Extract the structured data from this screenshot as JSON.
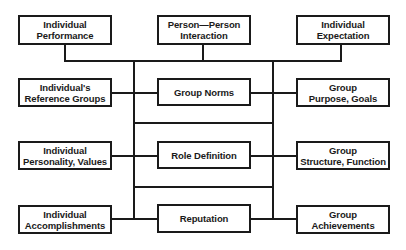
{
  "diagram": {
    "type": "block-diagram",
    "colors": {
      "stroke": "#1a1a1a",
      "background": "#ffffff",
      "text": "#1a1a1a"
    },
    "nodes": {
      "individual_performance": {
        "lines": [
          "Individual",
          "Performance"
        ]
      },
      "person_person_interaction": {
        "lines": [
          "Person—Person",
          "Interaction"
        ]
      },
      "individual_expectation": {
        "lines": [
          "Individual",
          "Expectation"
        ]
      },
      "reference_groups": {
        "lines": [
          "Individual's",
          "Reference Groups"
        ]
      },
      "group_norms": {
        "lines": [
          "Group Norms"
        ]
      },
      "group_purpose": {
        "lines": [
          "Group",
          "Purpose, Goals"
        ]
      },
      "personality_values": {
        "lines": [
          "Individual",
          "Personality, Values"
        ]
      },
      "role_definition": {
        "lines": [
          "Role Definition"
        ]
      },
      "group_structure": {
        "lines": [
          "Group",
          "Structure, Function"
        ]
      },
      "accomplishments": {
        "lines": [
          "Individual",
          "Accomplishments"
        ]
      },
      "reputation": {
        "lines": [
          "Reputation"
        ]
      },
      "group_achievements": {
        "lines": [
          "Group",
          "Achievements"
        ]
      }
    },
    "edges": [
      [
        "individual_performance",
        "central-bus"
      ],
      [
        "person_person_interaction",
        "central-bus"
      ],
      [
        "individual_expectation",
        "central-bus"
      ],
      [
        "reference_groups",
        "group_norms"
      ],
      [
        "group_norms",
        "group_purpose"
      ],
      [
        "personality_values",
        "role_definition"
      ],
      [
        "role_definition",
        "group_structure"
      ],
      [
        "accomplishments",
        "reputation"
      ],
      [
        "reputation",
        "group_achievements"
      ]
    ]
  }
}
